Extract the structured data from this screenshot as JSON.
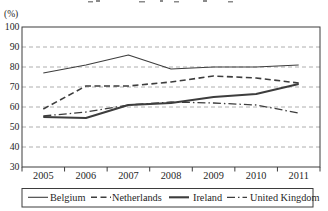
{
  "chart_data": {
    "type": "line",
    "categories": [
      "2005",
      "2006",
      "2007",
      "2008",
      "2009",
      "2010",
      "2011"
    ],
    "ylabel": "(%)",
    "ylim": [
      30,
      100
    ],
    "yticks": [
      100,
      90,
      80,
      70,
      60,
      50,
      40,
      30
    ],
    "grid": "horizontal-dashed",
    "legend_position": "bottom-box",
    "line_color": "#3d3d3d",
    "grid_color": "#9a9a9a",
    "series": [
      {
        "name": "Belgium",
        "values": [
          77,
          81,
          86,
          79,
          80,
          80,
          81
        ],
        "line_style": "solid",
        "line_width": 1.1
      },
      {
        "name": "Netherlands",
        "values": [
          59,
          70.5,
          70.5,
          72.5,
          75.5,
          74.5,
          72
        ],
        "line_style": "dashed",
        "line_width": 1.6
      },
      {
        "name": "Ireland",
        "values": [
          55,
          54.5,
          61,
          62,
          65,
          66.5,
          71.5
        ],
        "line_style": "solid",
        "line_width": 2.1
      },
      {
        "name": "United Kingdom",
        "values": [
          55.5,
          57.5,
          61,
          62.5,
          62,
          61,
          57
        ],
        "line_style": "dashdot",
        "line_width": 1.3
      }
    ]
  }
}
